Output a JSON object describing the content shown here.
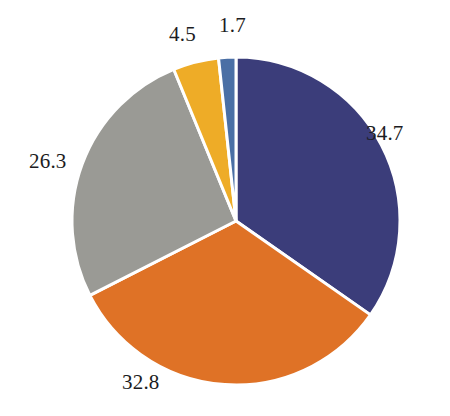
{
  "chart_data": {
    "type": "pie",
    "title": "",
    "subtitle": "",
    "xlabel": "",
    "ylabel": "",
    "legend_position": "none",
    "grid": false,
    "units": "percent",
    "total": 100.0,
    "start_angle_deg": 0,
    "direction": "clockwise",
    "categories": [
      "34.7",
      "32.8",
      "26.3",
      "4.5",
      "1.7"
    ],
    "values": [
      34.7,
      32.8,
      26.3,
      4.5,
      1.7
    ],
    "slices": [
      {
        "name": "slice-navy",
        "value": 34.7,
        "label": "34.7",
        "color": "#3b3d7a",
        "label_position": "right"
      },
      {
        "name": "slice-orange",
        "value": 32.8,
        "label": "32.8",
        "color": "#df7226",
        "label_position": "bottom-left"
      },
      {
        "name": "slice-gray",
        "value": 26.3,
        "label": "26.3",
        "color": "#9a9a95",
        "label_position": "left"
      },
      {
        "name": "slice-gold",
        "value": 4.5,
        "label": "4.5",
        "color": "#eeac27",
        "label_position": "top"
      },
      {
        "name": "slice-blue",
        "value": 1.7,
        "label": "1.7",
        "color": "#4a6fa5",
        "label_position": "top"
      }
    ],
    "geometry": {
      "center_x": 236,
      "center_y": 221,
      "radius": 164,
      "separator_color": "#ffffff",
      "separator_width": 3
    },
    "background_color": "#ffffff",
    "label_color": "#1c1c22"
  }
}
